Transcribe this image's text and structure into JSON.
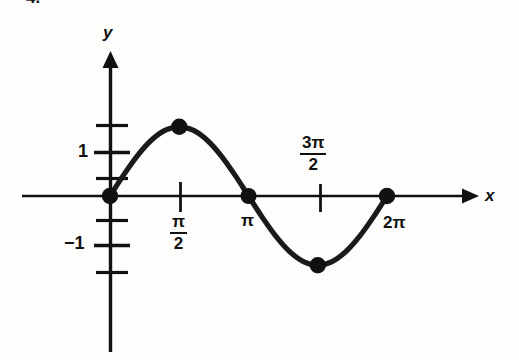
{
  "figure": {
    "problem_number": "4.",
    "axis_label_x": "x",
    "axis_label_y": "y"
  },
  "labels": {
    "y_one": "1",
    "y_negative_one": "−1",
    "x_pi_over_2_numerator": "π",
    "x_pi_over_2_denominator": "2",
    "x_pi": "π",
    "x_3pi_over_2_numerator": "3π",
    "x_3pi_over_2_denominator": "2",
    "x_2pi": "2π"
  },
  "colors": {
    "ink": "#111111",
    "curve": "#1a1a1a",
    "background": "#fdfdfb"
  },
  "chart_data": {
    "type": "line",
    "title": "",
    "subtitle": "",
    "xlabel": "x",
    "ylabel": "y",
    "function": "y = sin(x)",
    "grid": false,
    "legend": null,
    "xlim": [
      -0.4,
      7.6
    ],
    "ylim": [
      -1.75,
      2.2
    ],
    "xticks": [
      1.5707963,
      3.1415927,
      4.712389,
      6.2831853
    ],
    "xtick_labels": [
      "π/2",
      "π",
      "3π/2",
      "2π"
    ],
    "yticks": [
      -1.5,
      -1,
      -0.5,
      0.5,
      1,
      1.5
    ],
    "ytick_labels": [
      "",
      "−1",
      "",
      "",
      "1",
      ""
    ],
    "marked_points": [
      {
        "x": 0,
        "y": 0,
        "x_label": "0",
        "y_label": "0"
      },
      {
        "x": 1.5707963,
        "y": 1,
        "x_label": "π/2",
        "y_label": "1"
      },
      {
        "x": 3.1415927,
        "y": 0,
        "x_label": "π",
        "y_label": "0"
      },
      {
        "x": 4.712389,
        "y": -1,
        "x_label": "3π/2",
        "y_label": "−1"
      },
      {
        "x": 6.2831853,
        "y": 0,
        "x_label": "2π",
        "y_label": "0"
      }
    ],
    "x": [
      0,
      0.3141593,
      0.6283185,
      0.9424778,
      1.2566371,
      1.5707963,
      1.8849556,
      2.1991149,
      2.5132741,
      2.8274334,
      3.1415927,
      3.4557519,
      3.7699112,
      4.0840704,
      4.3982297,
      4.712389,
      5.0265482,
      5.3407075,
      5.6548668,
      5.969026,
      6.2831853
    ],
    "y": [
      0,
      0.309017,
      0.5877853,
      0.809017,
      0.9510565,
      1,
      0.9510565,
      0.809017,
      0.5877853,
      0.309017,
      0,
      -0.309017,
      -0.5877853,
      -0.809017,
      -0.9510565,
      -1,
      -0.9510565,
      -0.809017,
      -0.5877853,
      -0.309017,
      0
    ]
  }
}
